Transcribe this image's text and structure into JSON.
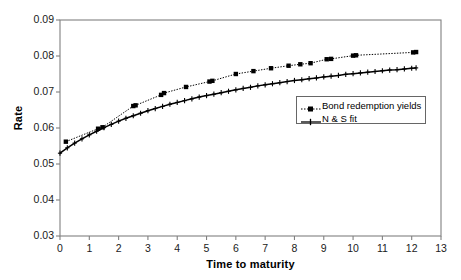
{
  "chart_data": {
    "type": "line",
    "title": "",
    "xlabel": "Time to maturity",
    "ylabel": "Rate",
    "xlim": [
      0,
      13
    ],
    "ylim": [
      0.03,
      0.09
    ],
    "xticks": [
      0,
      1,
      2,
      3,
      4,
      5,
      6,
      7,
      8,
      9,
      10,
      11,
      12,
      13
    ],
    "xtick_labels": [
      "0",
      "1",
      "2",
      "3",
      "4",
      "5",
      "6",
      "7",
      "8",
      "9",
      "10",
      "11",
      "12",
      "13"
    ],
    "yticks": [
      0.03,
      0.04,
      0.05,
      0.06,
      0.07,
      0.08,
      0.09
    ],
    "ytick_labels": [
      "0.03",
      "0.04",
      "0.05",
      "0.06",
      "0.07",
      "0.08",
      "0.09"
    ],
    "grid": false,
    "legend_position": "center-right",
    "series": [
      {
        "name": "Bond redemption yields",
        "style": "dotted",
        "marker": "square",
        "color": "#000000",
        "points": [
          [
            0.2,
            0.0562
          ],
          [
            1.3,
            0.0598
          ],
          [
            1.45,
            0.0602
          ],
          [
            2.5,
            0.0661
          ],
          [
            2.58,
            0.0663
          ],
          [
            3.45,
            0.0692
          ],
          [
            3.55,
            0.0697
          ],
          [
            4.3,
            0.0714
          ],
          [
            5.1,
            0.0729
          ],
          [
            5.2,
            0.0731
          ],
          [
            6.0,
            0.075
          ],
          [
            6.6,
            0.0758
          ],
          [
            7.2,
            0.0766
          ],
          [
            7.8,
            0.0773
          ],
          [
            8.2,
            0.0777
          ],
          [
            8.55,
            0.078
          ],
          [
            9.1,
            0.0791
          ],
          [
            9.25,
            0.0792
          ],
          [
            10.0,
            0.0801
          ],
          [
            10.1,
            0.0802
          ],
          [
            12.05,
            0.081
          ],
          [
            12.15,
            0.0811
          ]
        ]
      },
      {
        "name": "N & S fit",
        "style": "solid",
        "marker": "cross",
        "color": "#000000",
        "points": [
          [
            0.0,
            0.053
          ],
          [
            0.25,
            0.0545
          ],
          [
            0.5,
            0.0558
          ],
          [
            0.75,
            0.057
          ],
          [
            1.0,
            0.0581
          ],
          [
            1.25,
            0.0591
          ],
          [
            1.5,
            0.0601
          ],
          [
            1.75,
            0.061
          ],
          [
            2.0,
            0.0619
          ],
          [
            2.25,
            0.0627
          ],
          [
            2.5,
            0.0634
          ],
          [
            2.75,
            0.0641
          ],
          [
            3.0,
            0.0648
          ],
          [
            3.25,
            0.0654
          ],
          [
            3.5,
            0.066
          ],
          [
            3.75,
            0.0666
          ],
          [
            4.0,
            0.0671
          ],
          [
            4.25,
            0.0676
          ],
          [
            4.5,
            0.0681
          ],
          [
            4.75,
            0.0686
          ],
          [
            5.0,
            0.069
          ],
          [
            5.25,
            0.0694
          ],
          [
            5.5,
            0.0698
          ],
          [
            5.75,
            0.0702
          ],
          [
            6.0,
            0.0706
          ],
          [
            6.25,
            0.071
          ],
          [
            6.5,
            0.0713
          ],
          [
            6.75,
            0.0717
          ],
          [
            7.0,
            0.072
          ],
          [
            7.25,
            0.0723
          ],
          [
            7.5,
            0.0726
          ],
          [
            7.75,
            0.0729
          ],
          [
            8.0,
            0.0732
          ],
          [
            8.25,
            0.0734
          ],
          [
            8.5,
            0.0737
          ],
          [
            8.75,
            0.0739
          ],
          [
            9.0,
            0.0742
          ],
          [
            9.25,
            0.0744
          ],
          [
            9.5,
            0.0746
          ],
          [
            9.75,
            0.0749
          ],
          [
            10.0,
            0.0751
          ],
          [
            10.25,
            0.0753
          ],
          [
            10.5,
            0.0755
          ],
          [
            10.75,
            0.0757
          ],
          [
            11.0,
            0.0759
          ],
          [
            11.25,
            0.0761
          ],
          [
            11.5,
            0.0762
          ],
          [
            11.75,
            0.0764
          ],
          [
            12.0,
            0.0766
          ],
          [
            12.15,
            0.0767
          ]
        ]
      }
    ]
  },
  "legend": {
    "entries": [
      {
        "label": "Bond redemption yields",
        "marker": "square-marker-icon"
      },
      {
        "label": "N & S fit",
        "marker": "cross-marker-icon"
      }
    ]
  },
  "colors": {
    "axis": "#808080",
    "plot_border": "#808080",
    "series": "#000000",
    "background": "#ffffff"
  }
}
